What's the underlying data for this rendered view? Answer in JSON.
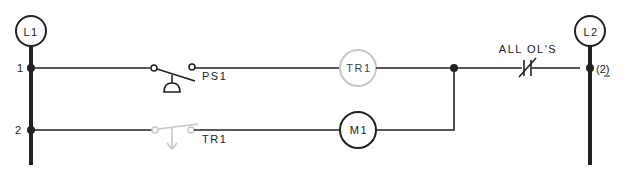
{
  "diagram": {
    "type": "ladder-logic",
    "rails": {
      "left": {
        "label": "L1"
      },
      "right": {
        "label": "L2"
      }
    },
    "rungs": [
      {
        "number": "1",
        "elements": [
          {
            "type": "pressure-switch-normally-open",
            "label": "PS1"
          },
          {
            "type": "coil",
            "label": "TR1",
            "state": "de-emphasized"
          },
          {
            "type": "overload-contacts-normally-closed",
            "label": "ALL OL'S"
          }
        ],
        "wire_reference": "(2)"
      },
      {
        "number": "2",
        "elements": [
          {
            "type": "timed-contact-normally-open",
            "label": "TR1",
            "state": "de-emphasized"
          },
          {
            "type": "coil",
            "label": "M1"
          }
        ]
      }
    ],
    "colors": {
      "wire": "#222222",
      "highlighted_off": "#c8c8c8"
    }
  }
}
